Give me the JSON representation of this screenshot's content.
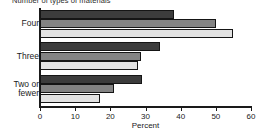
{
  "chart_data": {
    "type": "bar",
    "orientation": "horizontal",
    "title": "Number of types of materials",
    "xlabel": "Percent",
    "ylabel": "",
    "xlim": [
      0,
      60
    ],
    "xticks": [
      0,
      10,
      20,
      30,
      40,
      50,
      60
    ],
    "xticklabels": [
      "0",
      "10",
      "20",
      "30",
      "40",
      "50",
      "60"
    ],
    "grid": false,
    "legend": "none",
    "categories": [
      "Four",
      "Three",
      "Two or\nfewer"
    ],
    "series": [
      {
        "name": "series-1",
        "color": "#3c3c3c",
        "values": [
          38,
          34,
          29
        ]
      },
      {
        "name": "series-2",
        "color": "#838383",
        "values": [
          50,
          28.7,
          21
        ]
      },
      {
        "name": "series-3",
        "color": "#e2e2e2",
        "values": [
          55,
          28,
          17
        ]
      }
    ]
  },
  "axis": {
    "x_label": "Percent"
  }
}
